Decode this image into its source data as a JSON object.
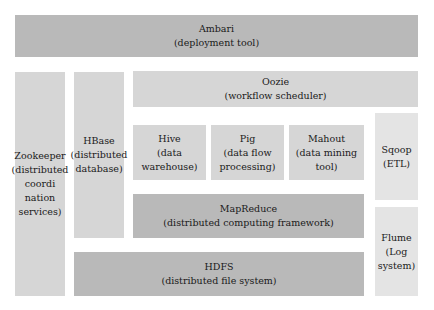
{
  "diagram": {
    "colors": {
      "dark": "#b9b9b9",
      "mid": "#d6d6d6",
      "light": "#e4e4e4"
    },
    "components": {
      "ambari": {
        "name": "Ambari",
        "desc": "(deployment tool)"
      },
      "zookeeper": {
        "name": "Zookeeper",
        "desc1": "(distributed",
        "desc2": "coordi",
        "desc3": "nation",
        "desc4": "services)"
      },
      "hbase": {
        "name": "HBase",
        "desc1": "(distributed",
        "desc2": "database)"
      },
      "oozie": {
        "name": "Oozie",
        "desc": "(workflow scheduler)"
      },
      "hive": {
        "name": "Hive",
        "desc": "(data warehouse)"
      },
      "pig": {
        "name": "Pig",
        "desc1": "(data flow",
        "desc2": "processing)"
      },
      "mahout": {
        "name": "Mahout",
        "desc": "(data mining tool)"
      },
      "sqoop": {
        "name": "Sqoop",
        "desc": "(ETL)"
      },
      "mapreduce": {
        "name": "MapReduce",
        "desc": "(distributed computing framework)"
      },
      "flume": {
        "name": "Flume",
        "desc1": "(Log",
        "desc2": "system)"
      },
      "hdfs": {
        "name": "HDFS",
        "desc": "(distributed file system)"
      }
    }
  }
}
